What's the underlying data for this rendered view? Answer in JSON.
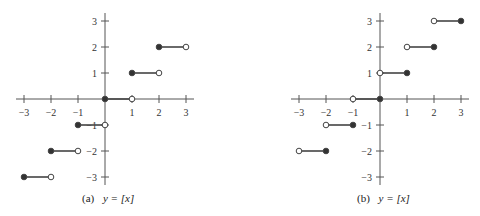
{
  "chart_data": [
    {
      "type": "line",
      "title": "(a) y = [x]",
      "caption_label": "(a)",
      "caption_eq": "y = [x]",
      "xlabel": "",
      "ylabel": "",
      "xlim": [
        -3,
        3
      ],
      "ylim": [
        -3,
        3
      ],
      "x_ticks": [
        -3,
        -2,
        -1,
        1,
        2,
        3
      ],
      "y_ticks": [
        -3,
        -2,
        -1,
        1,
        2,
        3
      ],
      "grid": false,
      "segments": [
        {
          "x0": -3,
          "x1": -2,
          "y": -3,
          "left": "closed",
          "right": "open"
        },
        {
          "x0": -2,
          "x1": -1,
          "y": -2,
          "left": "closed",
          "right": "open"
        },
        {
          "x0": -1,
          "x1": 0,
          "y": -1,
          "left": "closed",
          "right": "open"
        },
        {
          "x0": 0,
          "x1": 1,
          "y": 0,
          "left": "closed",
          "right": "open"
        },
        {
          "x0": 1,
          "x1": 2,
          "y": 1,
          "left": "closed",
          "right": "open"
        },
        {
          "x0": 2,
          "x1": 3,
          "y": 2,
          "left": "closed",
          "right": "open"
        }
      ]
    },
    {
      "type": "line",
      "title": "(b) y = [x]",
      "caption_label": "(b)",
      "caption_eq": "y = [x]",
      "xlabel": "",
      "ylabel": "",
      "xlim": [
        -3,
        3
      ],
      "ylim": [
        -3,
        3
      ],
      "x_ticks": [
        -3,
        -2,
        -1,
        1,
        2,
        3
      ],
      "y_ticks": [
        -3,
        -2,
        -1,
        1,
        2,
        3
      ],
      "grid": false,
      "segments": [
        {
          "x0": -3,
          "x1": -2,
          "y": -2,
          "left": "open",
          "right": "closed"
        },
        {
          "x0": -2,
          "x1": -1,
          "y": -1,
          "left": "open",
          "right": "closed"
        },
        {
          "x0": -1,
          "x1": 0,
          "y": 0,
          "left": "open",
          "right": "closed"
        },
        {
          "x0": 0,
          "x1": 1,
          "y": 1,
          "left": "open",
          "right": "closed"
        },
        {
          "x0": 1,
          "x1": 2,
          "y": 2,
          "left": "open",
          "right": "closed"
        },
        {
          "x0": 2,
          "x1": 3,
          "y": 3,
          "left": "open",
          "right": "closed"
        }
      ]
    }
  ],
  "colors": {
    "axis": "#555555",
    "segment": "#444444",
    "filled_dot": "#333333",
    "open_dot_fill": "#ffffff"
  }
}
